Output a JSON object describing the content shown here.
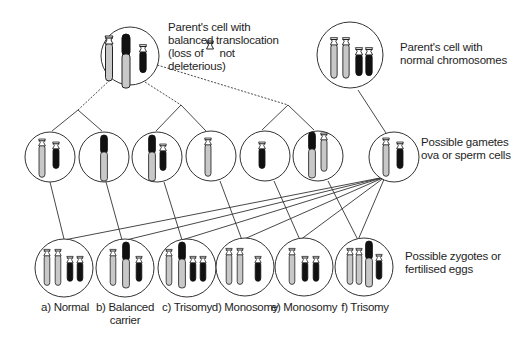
{
  "title_labels": {
    "translocation_parent": {
      "line1": "Parent's cell with",
      "line2": "balanced translocation",
      "line3_prefix": "(loss of",
      "line3_suffix": "not",
      "line4": "deleterious)"
    },
    "normal_parent": {
      "line1": "Parent's cell with",
      "line2": "normal chromosomes"
    },
    "gametes": {
      "line1": "Possible gametes",
      "line2": "ova or sperm cells"
    },
    "zygotes": {
      "line1": "Possible zygotes or",
      "line2": "fertilised eggs"
    }
  },
  "zygote_labels": [
    {
      "line1": "a) Normal",
      "line2": ""
    },
    {
      "line1": "b) Balanced",
      "line2": "carrier"
    },
    {
      "line1": "c) Trisomy",
      "line2": ""
    },
    {
      "line1": "d) Monosomy",
      "line2": ""
    },
    {
      "line1": "e) Monosomy",
      "line2": ""
    },
    {
      "line1": "f) Trisomy",
      "line2": ""
    }
  ],
  "colors": {
    "outline": "#333333",
    "light_chromosome": "#c8c8c8",
    "dark_chromosome": "#111111",
    "background": "#ffffff"
  }
}
